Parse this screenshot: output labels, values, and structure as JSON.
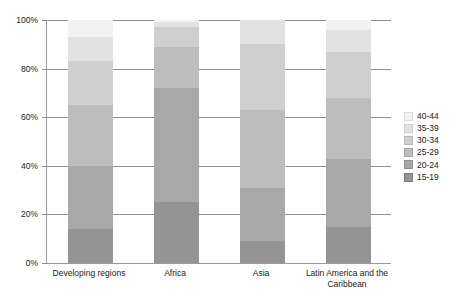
{
  "chart_data": {
    "type": "bar",
    "subtype": "stacked-percentage",
    "title": "",
    "xlabel": "",
    "ylabel": "",
    "ylim": [
      0,
      100
    ],
    "ytick_labels": [
      "0%",
      "20%",
      "40%",
      "60%",
      "80%",
      "100%"
    ],
    "ytick_values": [
      0,
      20,
      40,
      60,
      80,
      100
    ],
    "grid": true,
    "legend_position": "right",
    "categories": [
      "Developing regions",
      "Africa",
      "Asia",
      "Latin America and the Caribbean"
    ],
    "series": [
      {
        "name": "15-19",
        "color": "#949494",
        "values": [
          14,
          25,
          9,
          15
        ]
      },
      {
        "name": "20-24",
        "color": "#a8a8a8",
        "values": [
          26,
          47,
          22,
          28
        ]
      },
      {
        "name": "25-29",
        "color": "#bdbdbd",
        "values": [
          25,
          17,
          32,
          25
        ]
      },
      {
        "name": "30-34",
        "color": "#cfcfcf",
        "values": [
          18,
          8,
          27,
          19
        ]
      },
      {
        "name": "35-39",
        "color": "#e2e2e2",
        "values": [
          10,
          2,
          10,
          9
        ]
      },
      {
        "name": "40-44",
        "color": "#f2f2f2",
        "values": [
          7,
          1,
          0,
          4
        ]
      }
    ]
  },
  "legend": {
    "items": [
      {
        "label": "40-44",
        "color": "#f2f2f2"
      },
      {
        "label": "35-39",
        "color": "#e2e2e2"
      },
      {
        "label": "30-34",
        "color": "#cfcfcf"
      },
      {
        "label": "25-29",
        "color": "#bdbdbd"
      },
      {
        "label": "20-24",
        "color": "#a8a8a8"
      },
      {
        "label": "15-19",
        "color": "#949494"
      }
    ]
  },
  "axis": {
    "line_color": "#8f8f8f",
    "grid_color": "#8f8f8f",
    "text_color": "#1a1a1a"
  }
}
